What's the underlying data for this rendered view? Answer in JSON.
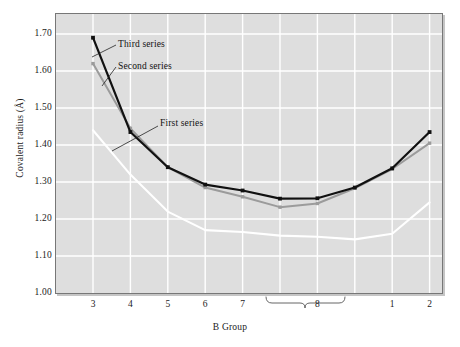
{
  "chart_data": {
    "type": "line",
    "title": "",
    "xlabel": "B Group",
    "ylabel": "Covalent radius (Å)",
    "categories": [
      "3",
      "4",
      "5",
      "6",
      "7",
      "8",
      "8",
      "8",
      "1",
      "2"
    ],
    "xtick_labels": [
      "3",
      "4",
      "5",
      "6",
      "7",
      "8",
      "1",
      "2"
    ],
    "ylim": [
      1.0,
      1.75
    ],
    "yticks": [
      "1.00",
      "1.10",
      "1.20",
      "1.30",
      "1.40",
      "1.50",
      "1.60",
      "1.70"
    ],
    "ytick_values": [
      1.0,
      1.1,
      1.2,
      1.3,
      1.4,
      1.5,
      1.6,
      1.7
    ],
    "grid": true,
    "grid_color": "#ffffff",
    "plot_background": "#dedede",
    "legend_position": "inline-annotations",
    "brace": {
      "label": "8",
      "spans_groups": [
        "8a",
        "8b",
        "8c"
      ]
    },
    "series": [
      {
        "name": "First series",
        "color": "#ffffff",
        "marker": "none",
        "values": [
          1.44,
          1.32,
          1.22,
          1.17,
          1.165,
          1.155,
          1.152,
          1.145,
          1.16,
          1.245
        ]
      },
      {
        "name": "Second series",
        "color": "#9b9b9b",
        "marker": "square",
        "values": [
          1.62,
          1.445,
          1.34,
          1.285,
          1.26,
          1.232,
          1.242,
          1.283,
          1.335,
          1.405
        ]
      },
      {
        "name": "Third series",
        "color": "#111111",
        "marker": "square",
        "values": [
          1.69,
          1.435,
          1.34,
          1.293,
          1.277,
          1.255,
          1.256,
          1.285,
          1.337,
          1.435
        ]
      }
    ],
    "annotations": [
      {
        "text": "Third series",
        "id": "annot-third"
      },
      {
        "text": "Second series",
        "id": "annot-second"
      },
      {
        "text": "First series",
        "id": "annot-first"
      }
    ]
  }
}
